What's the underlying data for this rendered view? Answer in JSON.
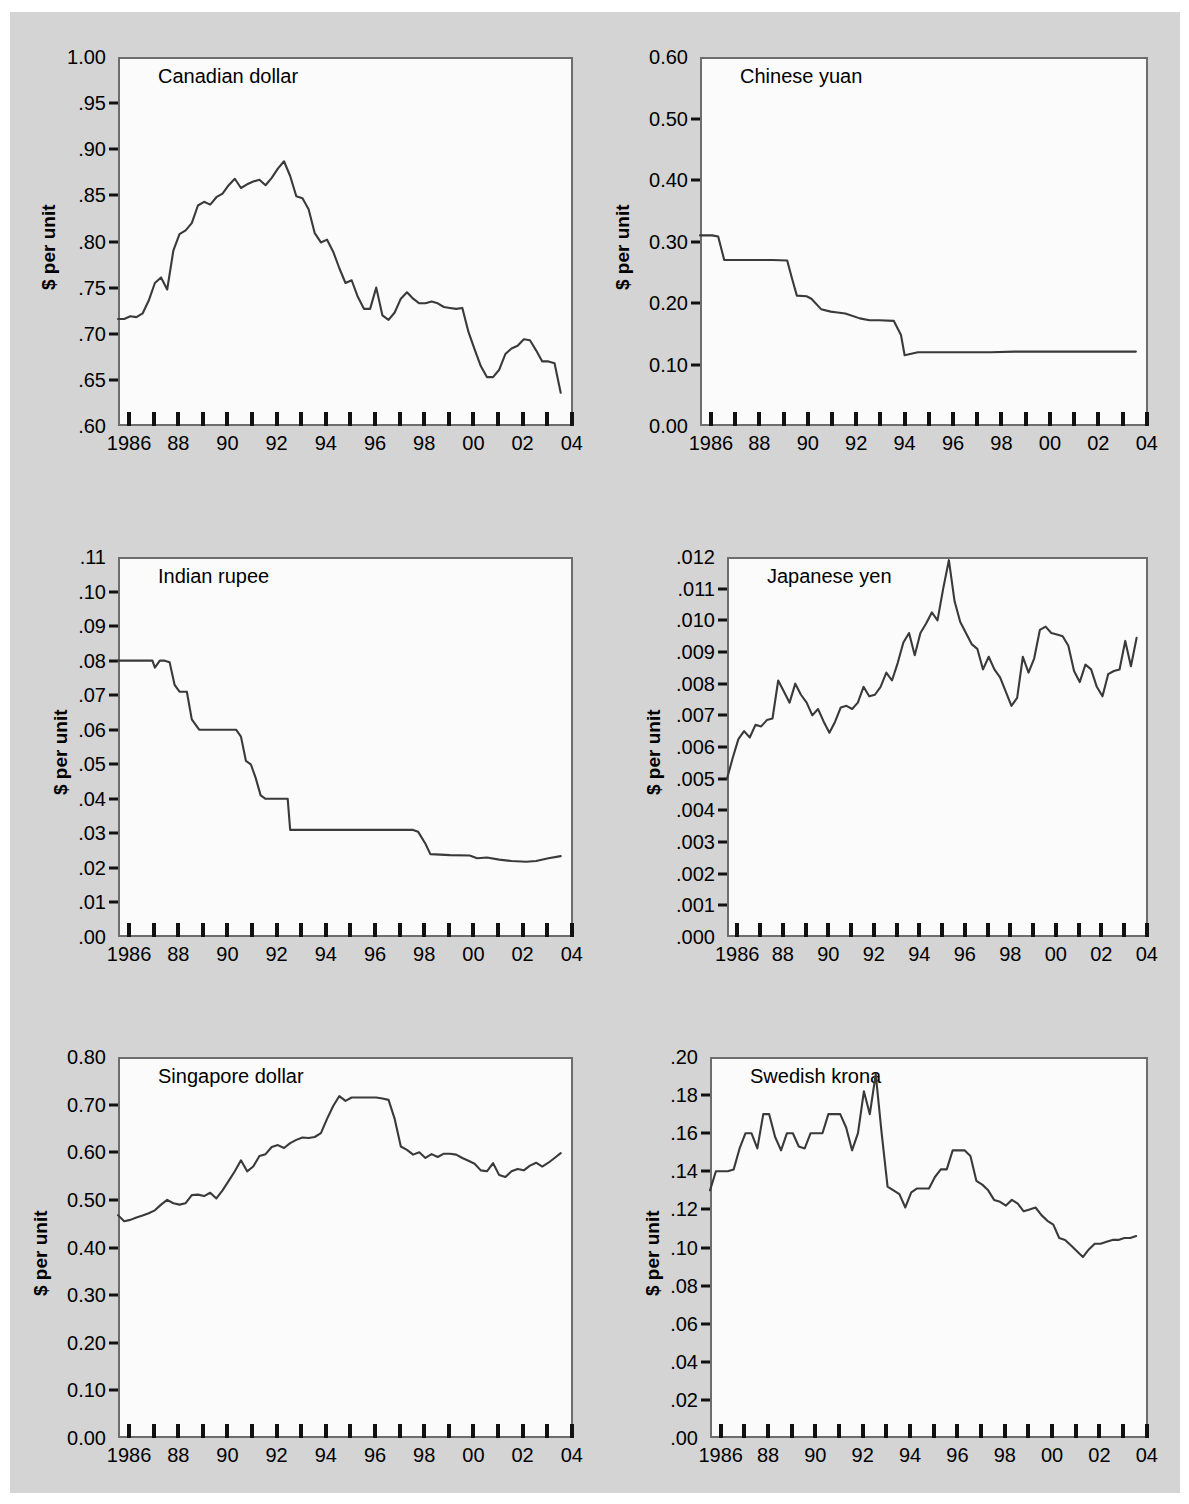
{
  "figure": {
    "background": "#d4d4d4",
    "panel_background": "#fbfbfb",
    "line_color": "#3a3a3a",
    "axis_color": "#6d6d6d",
    "y_axis_label": "$ per unit",
    "x_tick_labels": [
      "1986",
      "",
      "88",
      "",
      "90",
      "",
      "92",
      "",
      "94",
      "",
      "96",
      "",
      "98",
      "",
      "00",
      "",
      "02",
      "",
      "04"
    ],
    "x_tick_years": [
      1986,
      1987,
      1988,
      1989,
      1990,
      1991,
      1992,
      1993,
      1994,
      1995,
      1996,
      1997,
      1998,
      1999,
      2000,
      2001,
      2002,
      2003,
      2004
    ]
  },
  "chart_data": [
    {
      "type": "line",
      "title": "Canadian dollar",
      "xlabel": "",
      "ylabel": "$ per unit",
      "xlim": [
        1986,
        2004.5
      ],
      "ylim": [
        0.6,
        1.0
      ],
      "grid": false,
      "legend": "none",
      "y_ticks": [
        1.0,
        0.95,
        0.9,
        0.85,
        0.8,
        0.75,
        0.7,
        0.65,
        0.6
      ],
      "y_tick_labels": [
        "1.00",
        ".95",
        ".90",
        ".85",
        ".80",
        ".75",
        ".70",
        ".65",
        ".60"
      ],
      "x": [
        1986.0,
        1986.25,
        1986.5,
        1986.75,
        1987.0,
        1987.25,
        1987.5,
        1987.75,
        1988.0,
        1988.25,
        1988.5,
        1988.75,
        1989.0,
        1989.25,
        1989.5,
        1989.75,
        1990.0,
        1990.25,
        1990.5,
        1990.75,
        1991.0,
        1991.25,
        1991.5,
        1991.75,
        1992.0,
        1992.25,
        1992.5,
        1992.75,
        1993.0,
        1993.25,
        1993.5,
        1993.75,
        1994.0,
        1994.25,
        1994.5,
        1994.75,
        1995.0,
        1995.25,
        1995.5,
        1995.75,
        1996.0,
        1996.25,
        1996.5,
        1996.75,
        1997.0,
        1997.25,
        1997.5,
        1997.75,
        1998.0,
        1998.25,
        1998.5,
        1998.75,
        1999.0,
        1999.25,
        1999.5,
        1999.75,
        2000.0,
        2000.25,
        2000.5,
        2000.75,
        2001.0,
        2001.25,
        2001.5,
        2001.75,
        2002.0,
        2002.25,
        2002.5,
        2002.75,
        2003.0,
        2003.25,
        2003.5,
        2003.75,
        2004.0
      ],
      "y": [
        0.716,
        0.716,
        0.719,
        0.718,
        0.722,
        0.736,
        0.755,
        0.761,
        0.748,
        0.79,
        0.808,
        0.812,
        0.82,
        0.839,
        0.843,
        0.84,
        0.848,
        0.852,
        0.861,
        0.868,
        0.858,
        0.862,
        0.865,
        0.867,
        0.861,
        0.869,
        0.879,
        0.887,
        0.871,
        0.849,
        0.847,
        0.835,
        0.809,
        0.799,
        0.802,
        0.789,
        0.771,
        0.755,
        0.758,
        0.74,
        0.727,
        0.727,
        0.75,
        0.72,
        0.715,
        0.723,
        0.738,
        0.745,
        0.738,
        0.733,
        0.733,
        0.735,
        0.733,
        0.729,
        0.728,
        0.727,
        0.728,
        0.702,
        0.683,
        0.665,
        0.653,
        0.653,
        0.661,
        0.678,
        0.684,
        0.687,
        0.694,
        0.693,
        0.682,
        0.67,
        0.67,
        0.668,
        0.636,
        0.637,
        0.637,
        0.66,
        0.64,
        0.637,
        0.647,
        0.704,
        0.742,
        0.748,
        0.776
      ]
    },
    {
      "type": "line",
      "title": "Chinese yuan",
      "xlabel": "",
      "ylabel": "$ per unit",
      "xlim": [
        1986,
        2004.5
      ],
      "ylim": [
        0.0,
        0.6
      ],
      "grid": false,
      "legend": "none",
      "y_ticks": [
        0.6,
        0.5,
        0.4,
        0.3,
        0.2,
        0.1,
        0.0
      ],
      "y_tick_labels": [
        "0.60",
        "0.50",
        "0.40",
        "0.30",
        "0.20",
        "0.10",
        "0.00"
      ],
      "x": [
        1986.0,
        1986.5,
        1986.75,
        1987.0,
        1988.0,
        1989.0,
        1989.6,
        1989.8,
        1990.0,
        1990.4,
        1990.6,
        1991.0,
        1991.4,
        1991.6,
        1992.0,
        1992.6,
        1993.0,
        1993.4,
        1994.0,
        1994.3,
        1994.45,
        1995.0,
        1996.0,
        1997.0,
        1998.0,
        1999.0,
        2000.0,
        2001.0,
        2002.0,
        2003.0,
        2004.0
      ],
      "y": [
        0.31,
        0.31,
        0.308,
        0.27,
        0.27,
        0.27,
        0.269,
        0.24,
        0.212,
        0.211,
        0.207,
        0.19,
        0.186,
        0.185,
        0.183,
        0.175,
        0.172,
        0.172,
        0.171,
        0.148,
        0.115,
        0.12,
        0.12,
        0.12,
        0.12,
        0.121,
        0.121,
        0.121,
        0.121,
        0.121,
        0.121
      ]
    },
    {
      "type": "line",
      "title": "Indian rupee",
      "xlabel": "",
      "ylabel": "$ per unit",
      "xlim": [
        1986,
        2004.5
      ],
      "ylim": [
        0.0,
        0.11
      ],
      "grid": false,
      "legend": "none",
      "y_ticks": [
        0.11,
        0.1,
        0.09,
        0.08,
        0.07,
        0.06,
        0.05,
        0.04,
        0.03,
        0.02,
        0.01,
        0.0
      ],
      "y_tick_labels": [
        ".11",
        ".10",
        ".09",
        ".08",
        ".07",
        ".06",
        ".05",
        ".04",
        ".03",
        ".02",
        ".01",
        ".00"
      ],
      "x": [
        1986.0,
        1987.0,
        1987.4,
        1987.5,
        1987.7,
        1987.9,
        1988.1,
        1988.3,
        1988.5,
        1988.8,
        1989.0,
        1989.3,
        1990.0,
        1990.8,
        1991.0,
        1991.2,
        1991.4,
        1991.6,
        1991.8,
        1992.0,
        1992.3,
        1992.9,
        1993.0,
        1995.0,
        1997.0,
        1998.0,
        1998.2,
        1998.5,
        1998.7,
        1999.5,
        2000.3,
        2000.6,
        2001.0,
        2001.5,
        2002.0,
        2002.6,
        2003.0,
        2003.5,
        2004.0
      ],
      "y": [
        0.08,
        0.08,
        0.08,
        0.078,
        0.08,
        0.08,
        0.0795,
        0.073,
        0.071,
        0.071,
        0.063,
        0.06,
        0.06,
        0.06,
        0.058,
        0.051,
        0.05,
        0.046,
        0.041,
        0.04,
        0.04,
        0.04,
        0.031,
        0.031,
        0.031,
        0.031,
        0.0305,
        0.027,
        0.024,
        0.0237,
        0.0236,
        0.0228,
        0.023,
        0.0224,
        0.022,
        0.0218,
        0.022,
        0.0228,
        0.0234
      ]
    },
    {
      "type": "line",
      "title": "Japanese yen",
      "xlabel": "",
      "ylabel": "$ per unit",
      "xlim": [
        1986,
        2004.5
      ],
      "ylim": [
        0.0,
        0.012
      ],
      "grid": false,
      "legend": "none",
      "y_ticks": [
        0.012,
        0.011,
        0.01,
        0.009,
        0.008,
        0.007,
        0.006,
        0.005,
        0.004,
        0.003,
        0.002,
        0.001,
        0.0
      ],
      "y_tick_labels": [
        ".012",
        ".011",
        ".010",
        ".009",
        ".008",
        ".007",
        ".006",
        ".005",
        ".004",
        ".003",
        ".002",
        ".001",
        ".000"
      ],
      "x": [
        1986.0,
        1986.25,
        1986.5,
        1986.75,
        1987.0,
        1987.25,
        1987.5,
        1987.75,
        1988.0,
        1988.25,
        1988.5,
        1988.75,
        1989.0,
        1989.25,
        1989.5,
        1989.75,
        1990.0,
        1990.25,
        1990.5,
        1990.75,
        1991.0,
        1991.25,
        1991.5,
        1991.75,
        1992.0,
        1992.25,
        1992.5,
        1992.75,
        1993.0,
        1993.25,
        1993.5,
        1993.75,
        1994.0,
        1994.25,
        1994.5,
        1994.75,
        1995.0,
        1995.25,
        1995.5,
        1995.75,
        1996.0,
        1996.25,
        1996.5,
        1996.75,
        1997.0,
        1997.25,
        1997.5,
        1997.75,
        1998.0,
        1998.25,
        1998.5,
        1998.75,
        1999.0,
        1999.25,
        1999.5,
        1999.75,
        2000.0,
        2000.25,
        2000.5,
        2000.75,
        2001.0,
        2001.25,
        2001.5,
        2001.75,
        2002.0,
        2002.25,
        2002.5,
        2002.75,
        2003.0,
        2003.25,
        2003.5,
        2003.75,
        2004.0
      ],
      "y": [
        0.005,
        0.00565,
        0.00625,
        0.0065,
        0.0063,
        0.0067,
        0.00665,
        0.00685,
        0.0069,
        0.0081,
        0.00775,
        0.0074,
        0.008,
        0.00765,
        0.0074,
        0.007,
        0.0072,
        0.0068,
        0.00645,
        0.0068,
        0.00725,
        0.0073,
        0.0072,
        0.0074,
        0.0079,
        0.0076,
        0.00765,
        0.0079,
        0.00835,
        0.0081,
        0.00865,
        0.0093,
        0.0096,
        0.0089,
        0.0096,
        0.0099,
        0.01025,
        0.01,
        0.011,
        0.0119,
        0.0106,
        0.00995,
        0.0096,
        0.00925,
        0.0091,
        0.00845,
        0.00885,
        0.00845,
        0.0082,
        0.00775,
        0.0073,
        0.00755,
        0.00885,
        0.00835,
        0.0088,
        0.0097,
        0.0098,
        0.0096,
        0.00955,
        0.0095,
        0.0092,
        0.0084,
        0.00805,
        0.0086,
        0.00845,
        0.0079,
        0.0076,
        0.0083,
        0.0084,
        0.00845,
        0.00935,
        0.00855,
        0.00945
      ]
    },
    {
      "type": "line",
      "title": "Singapore dollar",
      "xlabel": "",
      "ylabel": "$ per unit",
      "xlim": [
        1986,
        2004.5
      ],
      "ylim": [
        0.0,
        0.8
      ],
      "grid": false,
      "legend": "none",
      "y_ticks": [
        0.8,
        0.7,
        0.6,
        0.5,
        0.4,
        0.3,
        0.2,
        0.1,
        0.0
      ],
      "y_tick_labels": [
        "0.80",
        "0.70",
        "0.60",
        "0.50",
        "0.40",
        "0.30",
        "0.20",
        "0.10",
        "0.00"
      ],
      "x": [
        1986.0,
        1986.25,
        1986.5,
        1986.75,
        1987.0,
        1987.25,
        1987.5,
        1987.75,
        1988.0,
        1988.25,
        1988.5,
        1988.75,
        1989.0,
        1989.25,
        1989.5,
        1989.75,
        1990.0,
        1990.25,
        1990.5,
        1990.75,
        1991.0,
        1991.25,
        1991.5,
        1991.75,
        1992.0,
        1992.25,
        1992.5,
        1992.75,
        1993.0,
        1993.25,
        1993.5,
        1993.75,
        1994.0,
        1994.25,
        1994.5,
        1994.75,
        1995.0,
        1995.25,
        1995.5,
        1995.75,
        1996.0,
        1996.25,
        1996.5,
        1996.75,
        1997.0,
        1997.25,
        1997.5,
        1997.75,
        1998.0,
        1998.25,
        1998.5,
        1998.75,
        1999.0,
        1999.25,
        1999.5,
        1999.75,
        2000.0,
        2000.25,
        2000.5,
        2000.75,
        2001.0,
        2001.25,
        2001.5,
        2001.75,
        2002.0,
        2002.25,
        2002.5,
        2002.75,
        2003.0,
        2003.25,
        2003.5,
        2003.75,
        2004.0
      ],
      "y": [
        0.468,
        0.455,
        0.458,
        0.463,
        0.467,
        0.472,
        0.478,
        0.49,
        0.5,
        0.493,
        0.49,
        0.493,
        0.51,
        0.511,
        0.508,
        0.515,
        0.503,
        0.52,
        0.54,
        0.56,
        0.583,
        0.56,
        0.57,
        0.592,
        0.596,
        0.611,
        0.615,
        0.609,
        0.619,
        0.626,
        0.631,
        0.63,
        0.632,
        0.64,
        0.67,
        0.697,
        0.718,
        0.708,
        0.715,
        0.715,
        0.715,
        0.715,
        0.715,
        0.713,
        0.71,
        0.67,
        0.612,
        0.605,
        0.595,
        0.6,
        0.588,
        0.596,
        0.59,
        0.597,
        0.597,
        0.595,
        0.588,
        0.582,
        0.576,
        0.562,
        0.56,
        0.577,
        0.552,
        0.548,
        0.56,
        0.565,
        0.562,
        0.572,
        0.578,
        0.57,
        0.578,
        0.588,
        0.598
      ]
    },
    {
      "type": "line",
      "title": "Swedish krona",
      "xlabel": "",
      "ylabel": "$ per unit",
      "xlim": [
        1986,
        2004.5
      ],
      "ylim": [
        0.0,
        0.2
      ],
      "grid": false,
      "legend": "none",
      "y_ticks": [
        0.2,
        0.18,
        0.16,
        0.14,
        0.12,
        0.1,
        0.08,
        0.06,
        0.04,
        0.02,
        0.0
      ],
      "y_tick_labels": [
        ".20",
        ".18",
        ".16",
        ".14",
        ".12",
        ".10",
        ".08",
        ".06",
        ".04",
        ".02",
        ".00"
      ],
      "x": [
        1986.0,
        1986.25,
        1986.5,
        1986.75,
        1987.0,
        1987.25,
        1987.5,
        1987.75,
        1988.0,
        1988.25,
        1988.5,
        1988.75,
        1989.0,
        1989.25,
        1989.5,
        1989.75,
        1990.0,
        1990.25,
        1990.5,
        1990.75,
        1991.0,
        1991.25,
        1991.5,
        1991.75,
        1992.0,
        1992.25,
        1992.5,
        1992.75,
        1993.0,
        1993.25,
        1993.5,
        1993.75,
        1994.0,
        1994.25,
        1994.5,
        1994.75,
        1995.0,
        1995.25,
        1995.5,
        1995.75,
        1996.0,
        1996.25,
        1996.5,
        1996.75,
        1997.0,
        1997.25,
        1997.5,
        1997.75,
        1998.0,
        1998.25,
        1998.5,
        1998.75,
        1999.0,
        1999.25,
        1999.5,
        1999.75,
        2000.0,
        2000.25,
        2000.5,
        2000.75,
        2001.0,
        2001.25,
        2001.5,
        2001.75,
        2002.0,
        2002.25,
        2002.5,
        2002.75,
        2003.0,
        2003.25,
        2003.5,
        2003.75,
        2004.0
      ],
      "y": [
        0.13,
        0.14,
        0.14,
        0.14,
        0.141,
        0.152,
        0.16,
        0.16,
        0.152,
        0.17,
        0.17,
        0.158,
        0.151,
        0.16,
        0.16,
        0.153,
        0.152,
        0.16,
        0.16,
        0.16,
        0.17,
        0.17,
        0.17,
        0.163,
        0.151,
        0.16,
        0.182,
        0.17,
        0.191,
        0.16,
        0.132,
        0.13,
        0.128,
        0.121,
        0.129,
        0.131,
        0.131,
        0.131,
        0.137,
        0.141,
        0.141,
        0.151,
        0.151,
        0.151,
        0.148,
        0.135,
        0.133,
        0.13,
        0.125,
        0.124,
        0.122,
        0.125,
        0.123,
        0.119,
        0.12,
        0.121,
        0.117,
        0.114,
        0.112,
        0.105,
        0.104,
        0.101,
        0.098,
        0.095,
        0.099,
        0.102,
        0.102,
        0.103,
        0.104,
        0.104,
        0.105,
        0.105,
        0.106
      ]
    }
  ]
}
